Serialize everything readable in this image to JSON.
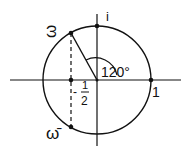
{
  "diagram": {
    "labels": {
      "i": "i",
      "one": "1",
      "omega": "ω",
      "omega_bar": "ω̄",
      "angle": "120°",
      "half_minus": "-",
      "half_num": "1",
      "half_den": "2"
    },
    "colors": {
      "stroke": "#111111",
      "background": "#ffffff"
    },
    "points": [
      {
        "name": "i",
        "x": 0,
        "y": 1
      },
      {
        "name": "1",
        "x": 1,
        "y": 0
      },
      {
        "name": "omega",
        "x": -0.5,
        "y": 0.866
      },
      {
        "name": "omega_bar",
        "x": -0.5,
        "y": -0.866
      },
      {
        "name": "minus_half",
        "x": -0.5,
        "y": 0
      }
    ]
  }
}
